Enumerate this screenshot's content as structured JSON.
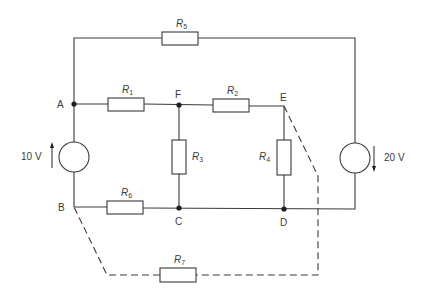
{
  "diagram": {
    "type": "electrical-circuit",
    "nodes": {
      "A": "A",
      "B": "B",
      "C": "C",
      "D": "D",
      "E": "E",
      "F": "F"
    },
    "resistors": {
      "R1": {
        "label": "R",
        "sub": "1",
        "between": [
          "A",
          "F"
        ]
      },
      "R2": {
        "label": "R",
        "sub": "2",
        "between": [
          "F",
          "E"
        ]
      },
      "R3": {
        "label": "R",
        "sub": "3",
        "between": [
          "F",
          "C"
        ]
      },
      "R4": {
        "label": "R",
        "sub": "4",
        "between": [
          "E",
          "D"
        ]
      },
      "R5": {
        "label": "R",
        "sub": "5",
        "between": [
          "A",
          "right-source-top"
        ]
      },
      "R6": {
        "label": "R",
        "sub": "6",
        "between": [
          "B",
          "C"
        ]
      },
      "R7": {
        "label": "R",
        "sub": "7",
        "between": [
          "B",
          "E"
        ],
        "style": "dashed"
      }
    },
    "sources": {
      "left": {
        "value": "10 V",
        "between": [
          "B",
          "A"
        ],
        "arrow": "up"
      },
      "right": {
        "value": "20 V",
        "between": [
          "top",
          "bottom"
        ],
        "arrow": "down"
      }
    }
  }
}
